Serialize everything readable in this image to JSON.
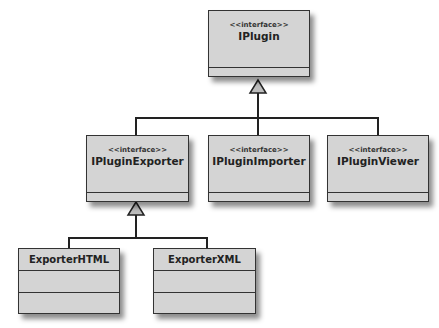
{
  "diagram": {
    "type": "uml-class-diagram",
    "nodes": [
      {
        "id": "iplugin",
        "stereotype": "<<interface>>",
        "name": "IPlugin"
      },
      {
        "id": "ipluginexporter",
        "stereotype": "<<interface>>",
        "name": "IPluginExporter"
      },
      {
        "id": "ipluginimporter",
        "stereotype": "<<interface>>",
        "name": "IPluginImporter"
      },
      {
        "id": "ipluginviewer",
        "stereotype": "<<interface>>",
        "name": "IPluginViewer"
      },
      {
        "id": "exporterhtml",
        "name": "ExporterHTML"
      },
      {
        "id": "exporterxml",
        "name": "ExporterXML"
      }
    ],
    "edges": [
      {
        "from": "ipluginexporter",
        "to": "iplugin",
        "kind": "generalization"
      },
      {
        "from": "ipluginimporter",
        "to": "iplugin",
        "kind": "generalization"
      },
      {
        "from": "ipluginviewer",
        "to": "iplugin",
        "kind": "generalization"
      },
      {
        "from": "exporterhtml",
        "to": "ipluginexporter",
        "kind": "generalization"
      },
      {
        "from": "exporterxml",
        "to": "ipluginexporter",
        "kind": "generalization"
      }
    ]
  },
  "colors": {
    "box_fill": "#d4d4d4",
    "border": "#333333",
    "background": "#ffffff"
  }
}
